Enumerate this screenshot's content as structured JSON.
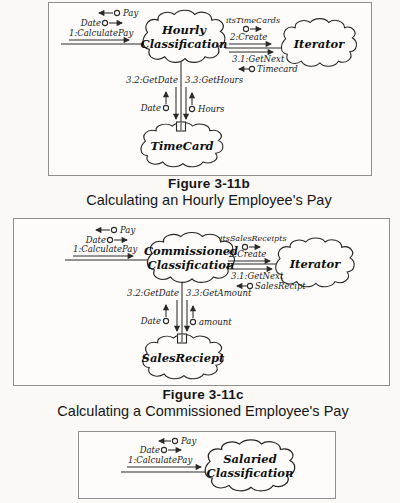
{
  "figures": {
    "b": {
      "tokens": {
        "pay": "Pay",
        "date": "Date"
      },
      "messages": {
        "calculate": "1:CalculatePay",
        "create": "2:Create",
        "getnext": "3.1:GetNext",
        "getdate": "3.2:GetDate",
        "getvalue": "3.3:GetHours"
      },
      "data_tokens": {
        "collection": "itsTimeCards",
        "return": "Timecard",
        "left": "Date",
        "right": "Hours"
      },
      "clouds": {
        "main1": "Hourly",
        "main2": "Classification",
        "iterator": "Iterator",
        "bottom": "TimeCard"
      },
      "caption": {
        "title": "Figure 3-11b",
        "subtitle": "Calculating an Hourly Employee's Pay"
      }
    },
    "c": {
      "tokens": {
        "pay": "Pay",
        "date": "Date"
      },
      "messages": {
        "calculate": "1:CalculatePay",
        "create": "2:Create",
        "getnext": "3.1:GetNext",
        "getdate": "3.2:GetDate",
        "getvalue": "3.3:GetAmount"
      },
      "data_tokens": {
        "collection": "itsSalesReceipts",
        "return": "SalesRecipt",
        "left": "Date",
        "right": "amount"
      },
      "clouds": {
        "main1": "Commissioned",
        "main2": "Classification",
        "iterator": "Iterator",
        "bottom": "SalesReciept"
      },
      "caption": {
        "title": "Figure 3-11c",
        "subtitle": "Calculating a Commissioned Employee's Pay"
      }
    },
    "d": {
      "tokens": {
        "pay": "Pay",
        "date": "Date"
      },
      "messages": {
        "calculate": "1:CalculatePay"
      },
      "clouds": {
        "main1": "Salaried",
        "main2": "Classification"
      }
    }
  }
}
